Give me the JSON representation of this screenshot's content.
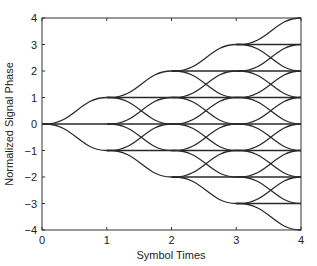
{
  "chart_data": {
    "type": "line",
    "title": "",
    "xlabel": "Symbol Times",
    "ylabel": "Normalized Signal Phase",
    "xlim": [
      0,
      4
    ],
    "ylim": [
      -4,
      4
    ],
    "xticks": [
      0,
      1,
      2,
      3,
      4
    ],
    "yticks": [
      -4,
      -3,
      -2,
      -1,
      0,
      1,
      2,
      3,
      4
    ],
    "grid": false,
    "legend": null,
    "tree": {
      "start_phase": 0,
      "steps": 4,
      "branch_deltas": [
        1,
        0,
        -1
      ],
      "nodes_per_time": {
        "0": [
          0
        ],
        "1": [
          -1,
          0,
          1
        ],
        "2": [
          -2,
          -1,
          0,
          1,
          2
        ],
        "3": [
          -3,
          -2,
          -1,
          0,
          1,
          2,
          3
        ],
        "4": [
          -4,
          -3,
          -2,
          -1,
          0,
          1,
          2,
          3,
          4
        ]
      }
    },
    "line_color": "#2a2a2a"
  },
  "plot_box": {
    "left": 42,
    "right": 301,
    "top": 18,
    "bottom": 230
  }
}
